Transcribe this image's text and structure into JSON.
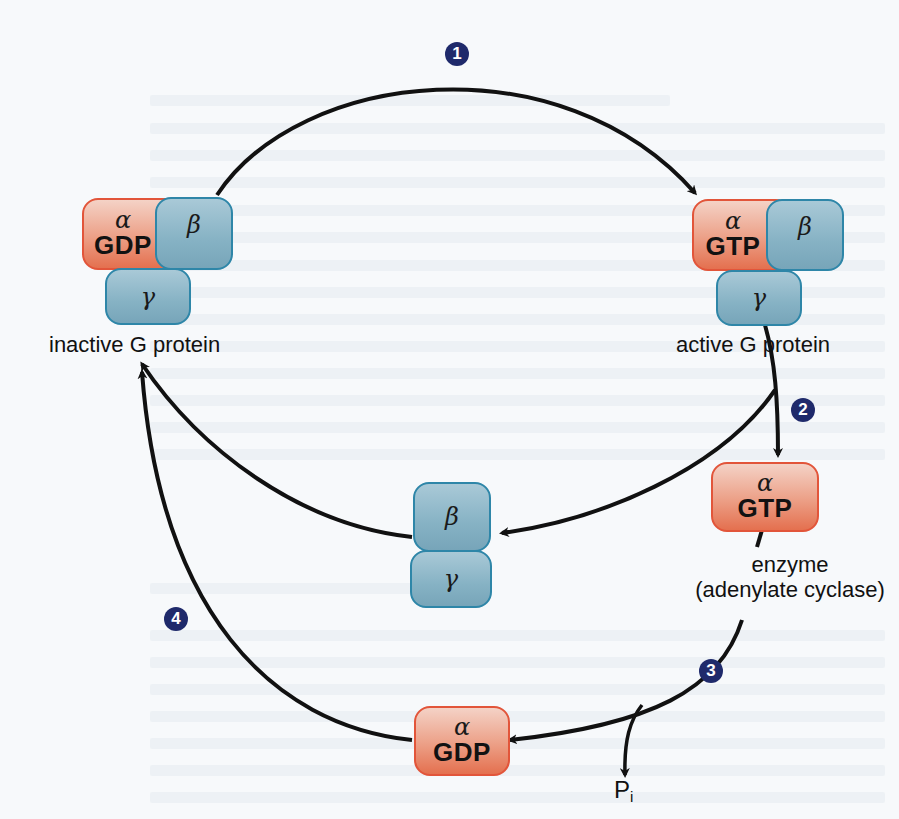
{
  "diagram": {
    "colors": {
      "alpha_fill": "#ec9f86",
      "alpha_border": "#e2553a",
      "subunit_fill": "#86b2c4",
      "subunit_border": "#2e86a8",
      "badge": "#1f2a6b",
      "arrow": "#111111",
      "background": "#f7f9fb"
    },
    "steps": [
      {
        "number": "1",
        "from": "inactive G protein",
        "to": "active G protein"
      },
      {
        "number": "2",
        "from": "active G protein",
        "to": "alpha-GTP bound to enzyme"
      },
      {
        "number": "3",
        "from": "alpha-GTP (enzyme)",
        "to": "alpha-GDP + Pi"
      },
      {
        "number": "4",
        "from": "alpha-GDP + beta-gamma",
        "to": "inactive G protein"
      }
    ],
    "inactive": {
      "alpha": "α",
      "nucleotide": "GDP",
      "beta": "β",
      "gamma": "γ",
      "label": "inactive G protein"
    },
    "active": {
      "alpha": "α",
      "nucleotide": "GTP",
      "beta": "β",
      "gamma": "γ",
      "label": "active G protein"
    },
    "free_beta_gamma": {
      "beta": "β",
      "gamma": "γ"
    },
    "enzyme_alpha": {
      "alpha": "α",
      "nucleotide": "GTP",
      "label_line1": "enzyme",
      "label_line2": "(adenylate cyclase)"
    },
    "hydrolyzed_alpha": {
      "alpha": "α",
      "nucleotide": "GDP"
    },
    "phosphate": {
      "symbol": "P",
      "subscript": "i"
    }
  }
}
